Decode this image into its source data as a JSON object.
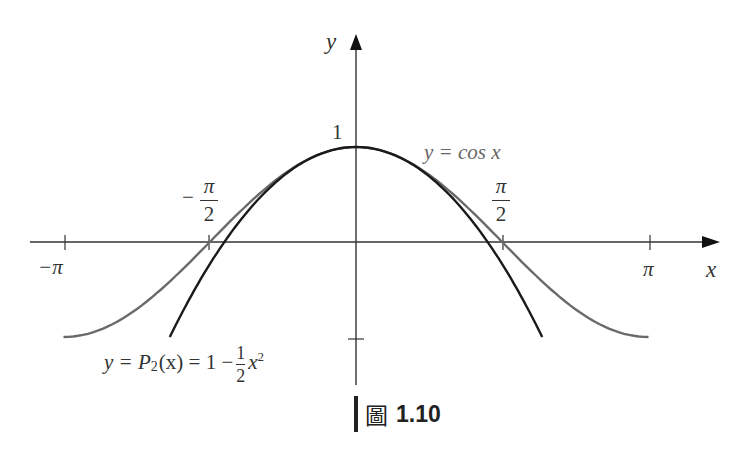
{
  "chart_data": {
    "type": "line",
    "title": "",
    "xlabel": "x",
    "ylabel": "y",
    "xlim": [
      -3.14159,
      3.14159
    ],
    "ylim": [
      -1,
      1
    ],
    "grid": false,
    "legend": "inline labels",
    "x_ticks": [
      {
        "value": -3.14159,
        "label": "−π"
      },
      {
        "value": -1.5708,
        "label": "−π/2"
      },
      {
        "value": 1.5708,
        "label": "π/2"
      },
      {
        "value": 3.14159,
        "label": "π"
      }
    ],
    "y_ticks": [
      {
        "value": 1,
        "label": "1"
      },
      {
        "value": -1,
        "label": ""
      }
    ],
    "series": [
      {
        "name": "y = cos x",
        "color": "#6a6a6a",
        "domain": [
          -3.14159,
          3.14159
        ],
        "x": [
          -3.14159,
          -2.3562,
          -1.5708,
          -0.7854,
          0,
          0.7854,
          1.5708,
          2.3562,
          3.14159
        ],
        "values": [
          -1,
          -0.7071,
          0,
          0.7071,
          1,
          0.7071,
          0,
          -0.7071,
          -1
        ]
      },
      {
        "name": "y = P2(x) = 1 − (1/2)x²",
        "color": "#1a1a1a",
        "domain": [
          -2,
          2
        ],
        "x": [
          -2,
          -1.5,
          -1,
          -0.5,
          0,
          0.5,
          1,
          1.5,
          2
        ],
        "values": [
          -1,
          -0.125,
          0.5,
          0.875,
          1,
          0.875,
          0.5,
          -0.125,
          -1
        ]
      }
    ],
    "annotations": [
      {
        "text": "y = cos x",
        "near": "upper right of peak"
      },
      {
        "text": "y = P2(x) = 1 − (1/2)x²",
        "near": "lower left"
      }
    ]
  },
  "labels": {
    "y_axis": "y",
    "x_axis": "x",
    "one": "1",
    "neg_pi": "−π",
    "pi": "π",
    "pi_sym": "π",
    "two": "2",
    "minus": "−",
    "cos_label": "y = cos x",
    "p2_prefix": "y = P",
    "p2_sub": "2",
    "p2_mid": "(x) = 1 −",
    "p2_frac_num": "1",
    "p2_frac_den": "2",
    "p2_x": "x",
    "p2_sup": "2"
  },
  "caption": {
    "kanji": "圖",
    "number": "1.10"
  },
  "colors": {
    "axis": "#333333",
    "cos": "#6a6a6a",
    "taylor": "#1a1a1a"
  }
}
